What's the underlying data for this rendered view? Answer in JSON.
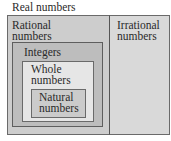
{
  "title": "Real numbers",
  "regions": {
    "rational": {
      "label_line1": "Rational",
      "label_line2": "numbers",
      "fill": "#cdcdcd"
    },
    "irrational": {
      "label_line1": "Irrational",
      "label_line2": "numbers",
      "fill": "#d9d9d9"
    },
    "integers": {
      "label": "Integers",
      "fill": "#bdbdbd"
    },
    "whole": {
      "label_line1": "Whole",
      "label_line2": "numbers",
      "fill": "#e6e6e6"
    },
    "natural": {
      "label_line1": "Natural",
      "label_line2": "numbers",
      "fill": "#cbcbcb"
    }
  },
  "border_color": "#6a6a6a"
}
